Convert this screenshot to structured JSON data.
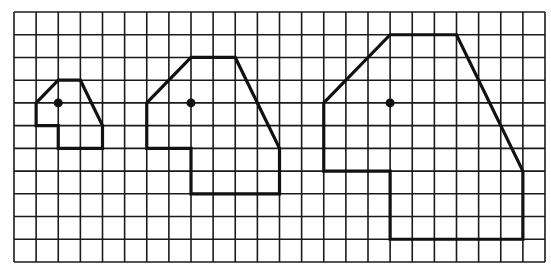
{
  "diagram": {
    "type": "grid-dilation",
    "grid": {
      "columns": 24,
      "rows": 11,
      "origin_px": [
        14,
        12
      ],
      "extent_px": [
        545,
        262
      ],
      "line_color": "#1a1a1a"
    },
    "shapes": [
      {
        "id": "small",
        "scale": 1,
        "vertices": [
          [
            1,
            4
          ],
          [
            2,
            3
          ],
          [
            3,
            3
          ],
          [
            4,
            5
          ],
          [
            4,
            6
          ],
          [
            2,
            6
          ],
          [
            2,
            5
          ],
          [
            1,
            5
          ]
        ],
        "center": [
          2,
          4
        ]
      },
      {
        "id": "medium",
        "scale": 2,
        "vertices": [
          [
            6,
            4
          ],
          [
            8,
            2
          ],
          [
            10,
            2
          ],
          [
            12,
            6
          ],
          [
            12,
            8
          ],
          [
            8,
            8
          ],
          [
            8,
            6
          ],
          [
            6,
            6
          ]
        ],
        "center": [
          8,
          4
        ]
      },
      {
        "id": "large",
        "scale": 3,
        "vertices": [
          [
            14,
            4
          ],
          [
            17,
            1
          ],
          [
            20,
            1
          ],
          [
            23,
            7
          ],
          [
            23,
            10
          ],
          [
            17,
            10
          ],
          [
            17,
            7
          ],
          [
            14,
            7
          ]
        ],
        "center": [
          17,
          4
        ]
      }
    ],
    "stroke_color": "#111111"
  }
}
